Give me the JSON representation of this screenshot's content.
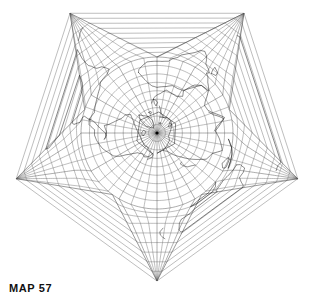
{
  "figure": {
    "caption": "MAP 57",
    "background_color": "#ffffff",
    "graticule_color": "#6d6d6d",
    "coastline_color": "#111111",
    "outline_color": "#4a4a4a"
  },
  "chart_data": {
    "type": "map",
    "projection": "Berghaus star (five-pointed) azimuthal equidistant",
    "center": {
      "label": "North Pole",
      "lat": 90,
      "lon": 0,
      "x": 157,
      "y": 133
    },
    "lobes": 5,
    "lobe_count_label": "5 points",
    "inner_radius": 76,
    "outer_radius": 148,
    "rotation_deg": -90,
    "graticule": {
      "parallel_interval_deg": 10,
      "meridian_interval_deg": 10,
      "major_meridian_interval_deg": 30,
      "parallels": [
        80,
        70,
        60,
        50,
        40,
        30,
        20,
        10,
        0,
        -10,
        -20,
        -30,
        -40,
        -50,
        -60,
        -70,
        -80,
        -90
      ],
      "equator_lat": 0,
      "grid": "on"
    },
    "star_tips": [
      {
        "label": "top-left-point",
        "x": 73,
        "y": 9
      },
      {
        "label": "top-right-point",
        "x": 242,
        "y": 10
      },
      {
        "label": "right-point",
        "x": 297,
        "y": 178
      },
      {
        "label": "bottom-point",
        "x": 158,
        "y": 277
      },
      {
        "label": "left-point",
        "x": 21,
        "y": 178
      }
    ],
    "star_notches": [
      {
        "label": "top-notch",
        "x": 160,
        "y": 57
      },
      {
        "label": "right-notch",
        "x": 229,
        "y": 111
      },
      {
        "label": "bottom-right-notch",
        "x": 202,
        "y": 194
      },
      {
        "label": "bottom-left-notch",
        "x": 112,
        "y": 194
      },
      {
        "label": "left-notch",
        "x": 85,
        "y": 111
      }
    ],
    "landmasses": [
      "Eurasia",
      "Africa",
      "North America",
      "South America",
      "Australia",
      "Greenland",
      "Antarctica fragments"
    ],
    "xlabel": "",
    "ylabel": "",
    "legend": "none"
  }
}
